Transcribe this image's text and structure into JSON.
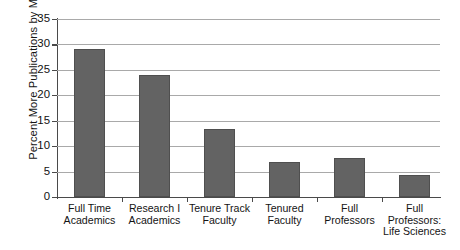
{
  "chart_data": {
    "type": "bar",
    "title": "",
    "xlabel": "",
    "ylabel": "Percent More Publications by Men",
    "categories": [
      "Full Time\nAcademics",
      "Research I\nAcademics",
      "Tenure Track\nFaculty",
      "Tenured\nFaculty",
      "Full\nProfessors",
      "Full\nProfessors:\nLife Sciences"
    ],
    "category_lines": [
      [
        "Full Time",
        "Academics"
      ],
      [
        "Research I",
        "Academics"
      ],
      [
        "Tenure Track",
        "Faculty"
      ],
      [
        "Tenured",
        "Faculty"
      ],
      [
        "Full",
        "Professors"
      ],
      [
        "Full",
        "Professors:",
        "Life Sciences"
      ]
    ],
    "values": [
      29.2,
      24.0,
      13.3,
      6.8,
      7.6,
      4.3
    ],
    "ylim": [
      0,
      35
    ],
    "yticks": [
      0,
      5,
      10,
      15,
      20,
      25,
      30,
      35
    ],
    "ytick_labels": [
      "0",
      "5",
      "10",
      "15",
      "20",
      "25",
      "30",
      "35"
    ],
    "grid": true,
    "grid_axis": "y",
    "legend": "none",
    "bar_color": "#636363",
    "bar_edge_color": "#4f4f4f",
    "grid_color": "#a9a9a9",
    "axis_color": "#4a4a4a",
    "background": "#ffffff"
  }
}
